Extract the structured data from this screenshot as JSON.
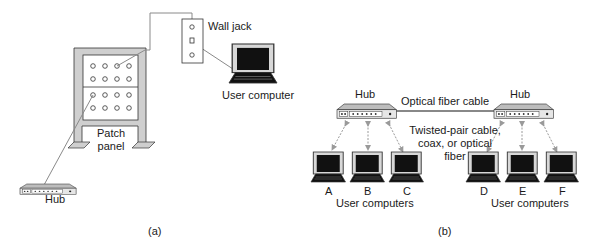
{
  "panel_a": {
    "wall_jack_label": "Wall jack",
    "user_computer_label": "User computer",
    "patch_panel_label_line1": "Patch",
    "patch_panel_label_line2": "panel",
    "hub_label": "Hub",
    "caption": "(a)"
  },
  "panel_b": {
    "hub_left_label": "Hub",
    "hub_right_label": "Hub",
    "optical_fiber_label": "Optical fiber cable",
    "medium_label_line1": "Twisted-pair cable,",
    "medium_label_line2": "coax, or optical",
    "medium_label_line3": "fiber",
    "computers": [
      {
        "label": "A"
      },
      {
        "label": "B"
      },
      {
        "label": "C"
      },
      {
        "label": "D"
      },
      {
        "label": "E"
      },
      {
        "label": "F"
      }
    ],
    "user_computers_left": "User computers",
    "user_computers_right": "User computers",
    "caption": "(b)"
  },
  "colors": {
    "frame_gray": "#cfcfcf",
    "outline": "#333333",
    "screen": "#111111",
    "cable": "#8a8a8a"
  }
}
